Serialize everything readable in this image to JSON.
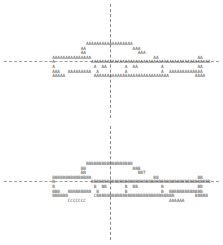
{
  "figures": [
    {
      "name": "car-figure-top",
      "glyph": "A",
      "lines": [
        "               AAAAAAAAAAAAAAAAAA",
        "             AA                  AAA",
        "             AA                    AAA",
        "  AAAAAAAAAAAAAAA                        AA               AA",
        "  A              AAAAAAAAAAAAAAAAAAAAAAAAAAAAAAAAAAAAAAAAAAAAAA",
        "  A               A  AA       A  AA         A             AA",
        "  AAA   AAAAAAAAA  A          A             A  AAAAAAAAAAAAA",
        "  AAAAA           AAAAAAAAAAAAAAAAAAAAAAAAAAAAA          AAAA"
      ]
    },
    {
      "name": "car-figure-bottom",
      "glyph": "B",
      "lines": [
        "               BBBBBBBBBBBBBBBBBB",
        "             BB                  BBB",
        "             BB                    BBT",
        "  BBBBBBBBBBBBBBB                        BB               BB",
        "  B              BBBBBBBBBBBBBBBBBBBBBBBBBBBBBBBBBBBBBBBBBBBBBB",
        "  B               B  BB       B  BB         B             BB",
        "  BBB   BBBBBBBBB  B          B             B  BBBBBBBBBBBBB",
        "  BBBBBB          CBBBBBBBBBBBBBBBBBBBBBBBBBBBBBB        BBBBB",
        "        CCCCCCC                                AAAAAA"
      ]
    }
  ],
  "colors": {
    "text": "#555555",
    "axis": "#8a8a8a",
    "background": "#ffffff"
  }
}
